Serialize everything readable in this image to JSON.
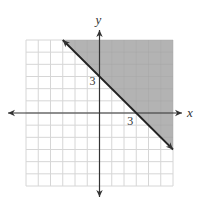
{
  "chart_data": {
    "type": "line",
    "title": "",
    "xlabel": "x",
    "ylabel": "y",
    "xlim": [
      -6,
      6
    ],
    "ylim": [
      -6,
      6
    ],
    "grid": true,
    "grid_step": 1,
    "legend": "none",
    "inequality": "y >= -x + 3",
    "boundary_line": {
      "slope": -1,
      "intercept": 3,
      "style": "solid",
      "arrows": "both",
      "x_range": [
        -3,
        6
      ]
    },
    "shaded_region": "above-right of line",
    "annotations": [
      {
        "text": "3",
        "x": 0,
        "y": 3,
        "meaning": "y-intercept"
      },
      {
        "text": "3",
        "x": 3,
        "y": 0,
        "meaning": "x-intercept"
      }
    ],
    "colors": {
      "shade": "#b3b3b3",
      "grid": "#d6d6d6",
      "axis": "#333333",
      "line": "#222222"
    }
  }
}
